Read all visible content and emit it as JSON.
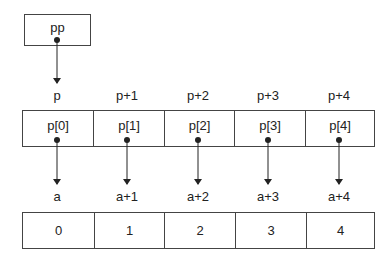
{
  "pointer_to_pointer": {
    "label": "pp"
  },
  "pointer_array": {
    "offset_labels": [
      "p",
      "p+1",
      "p+2",
      "p+3",
      "p+4"
    ],
    "cells": [
      "p[0]",
      "p[1]",
      "p[2]",
      "p[3]",
      "p[4]"
    ]
  },
  "int_array": {
    "offset_labels": [
      "a",
      "a+1",
      "a+2",
      "a+3",
      "a+4"
    ],
    "cells": [
      "0",
      "1",
      "2",
      "3",
      "4"
    ]
  },
  "colors": {
    "line": "#222222",
    "border": "#444444",
    "background": "#ffffff"
  }
}
